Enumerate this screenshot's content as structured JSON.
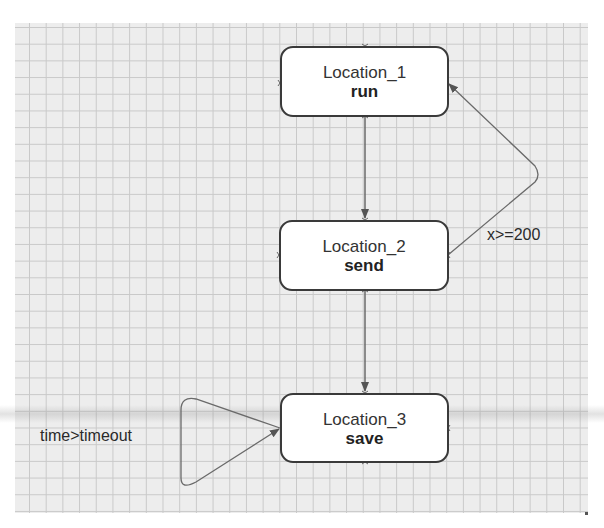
{
  "diagram": {
    "type": "state-machine",
    "locations": [
      {
        "id": "loc1",
        "name": "Location_1",
        "invariant": "run"
      },
      {
        "id": "loc2",
        "name": "Location_2",
        "invariant": "send"
      },
      {
        "id": "loc3",
        "name": "Location_3",
        "invariant": "save"
      }
    ],
    "transitions": [
      {
        "from": "Location_1",
        "to": "Location_2",
        "label": ""
      },
      {
        "from": "Location_2",
        "to": "Location_3",
        "label": ""
      },
      {
        "from": "Location_2",
        "to": "Location_1",
        "label": "x>=200"
      },
      {
        "from": "Location_3",
        "to": "Location_3",
        "label": "time>timeout"
      }
    ]
  },
  "colors": {
    "grid_background": "#ededed",
    "grid_line": "#c9c9c9",
    "node_border": "#3a3a3a",
    "edge": "#6a6a6a"
  }
}
